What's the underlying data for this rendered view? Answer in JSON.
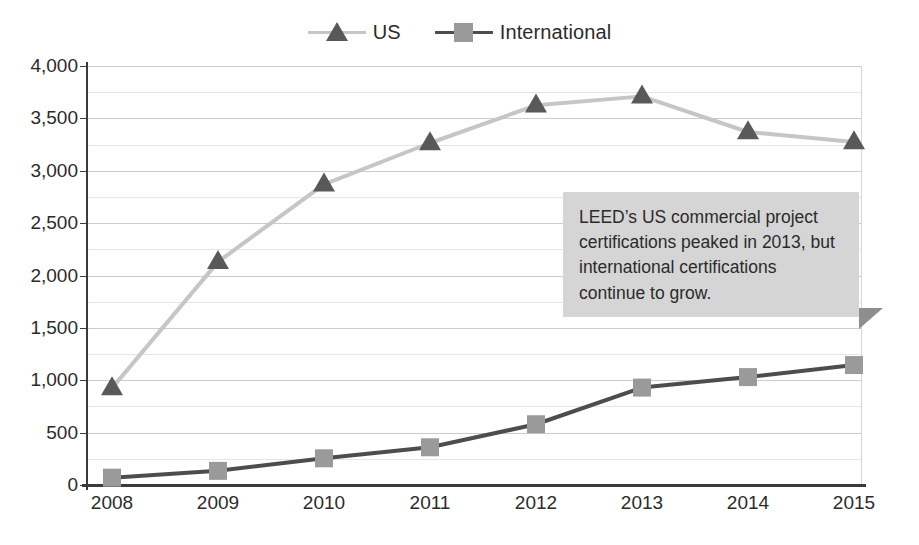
{
  "chart_data": {
    "type": "line",
    "title": "",
    "xlabel": "",
    "ylabel": "",
    "categories": [
      "2008",
      "2009",
      "2010",
      "2011",
      "2012",
      "2013",
      "2014",
      "2015"
    ],
    "x": [
      2008,
      2009,
      2010,
      2011,
      2012,
      2013,
      2014,
      2015
    ],
    "series": [
      {
        "name": "US",
        "values": [
          925,
          2130,
          2870,
          3265,
          3625,
          3710,
          3370,
          3275
        ],
        "line_color": "#c6c6c6",
        "marker": "triangle",
        "marker_color": "#595959"
      },
      {
        "name": "International",
        "values": [
          70,
          135,
          255,
          360,
          580,
          930,
          1030,
          1145
        ],
        "line_color": "#4d4d4d",
        "marker": "square",
        "marker_color": "#9a9a9a"
      }
    ],
    "ylim": [
      0,
      4000
    ],
    "ytick_values": [
      0,
      500,
      1000,
      1500,
      2000,
      2500,
      3000,
      3500,
      4000
    ],
    "ytick_labels": [
      "0",
      "500",
      "1,000",
      "1,500",
      "2,000",
      "2,500",
      "3,000",
      "3,500",
      "4,000"
    ],
    "minor_tick_interval": 250,
    "grid": true,
    "legend_position": "top-center",
    "annotations": [
      {
        "name": "callout",
        "text": "LEED’s US commercial project certifications peaked in 2013, but international certifications continue to grow.",
        "background": "#d5d5d5",
        "tail_color": "#8e8e8e"
      }
    ]
  },
  "legend": {
    "entries": [
      {
        "label": "US"
      },
      {
        "label": "International"
      }
    ]
  },
  "callout": {
    "text": "LEED’s US commercial project certifications peaked in 2013, but international certifications continue to grow."
  },
  "colors": {
    "us_line": "#c6c6c6",
    "us_marker": "#595959",
    "intl_line": "#4d4d4d",
    "intl_marker": "#9a9a9a",
    "axis": "#3b3b3b",
    "grid_major": "#c9cdd2",
    "grid_minor": "#e3e6e9",
    "text": "#2b2b2b",
    "callout_bg": "#d5d5d5",
    "callout_tail": "#8e8e8e"
  }
}
